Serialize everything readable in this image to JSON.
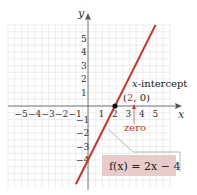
{
  "chart_data": {
    "type": "line",
    "title": "",
    "xlabel": "x",
    "ylabel": "y",
    "xlim": [
      -6,
      6
    ],
    "ylim": [
      -6,
      6
    ],
    "grid": true,
    "x_ticks": [
      "−5",
      "−4",
      "−3",
      "−2",
      "−1",
      "1",
      "2",
      "3",
      "4",
      "5"
    ],
    "y_ticks": [
      "5",
      "4",
      "3",
      "2",
      "1",
      "−1",
      "−2",
      "−3",
      "−4"
    ],
    "series": [
      {
        "name": "f(x) = 2x − 4",
        "color": "#c0392b",
        "x": [
          -0.9,
          5
        ],
        "y": [
          -5.8,
          6
        ]
      }
    ],
    "points": [
      {
        "x": 2,
        "y": 0,
        "label": "(2, 0)"
      }
    ],
    "annotations": {
      "intercept_label": "x-intercept",
      "intercept_italic": "x",
      "intercept_rest": "-intercept",
      "point_open": "(",
      "point_x": "2",
      "point_rest": ", 0)",
      "zero_label": "zero",
      "function_label": "f(x) = 2x − 4"
    }
  },
  "colors": {
    "line": "#c0392b",
    "grid": "#e3e3e3",
    "axis": "#555555",
    "label_box": "#e8cccc",
    "accent_text": "#c0392b"
  }
}
